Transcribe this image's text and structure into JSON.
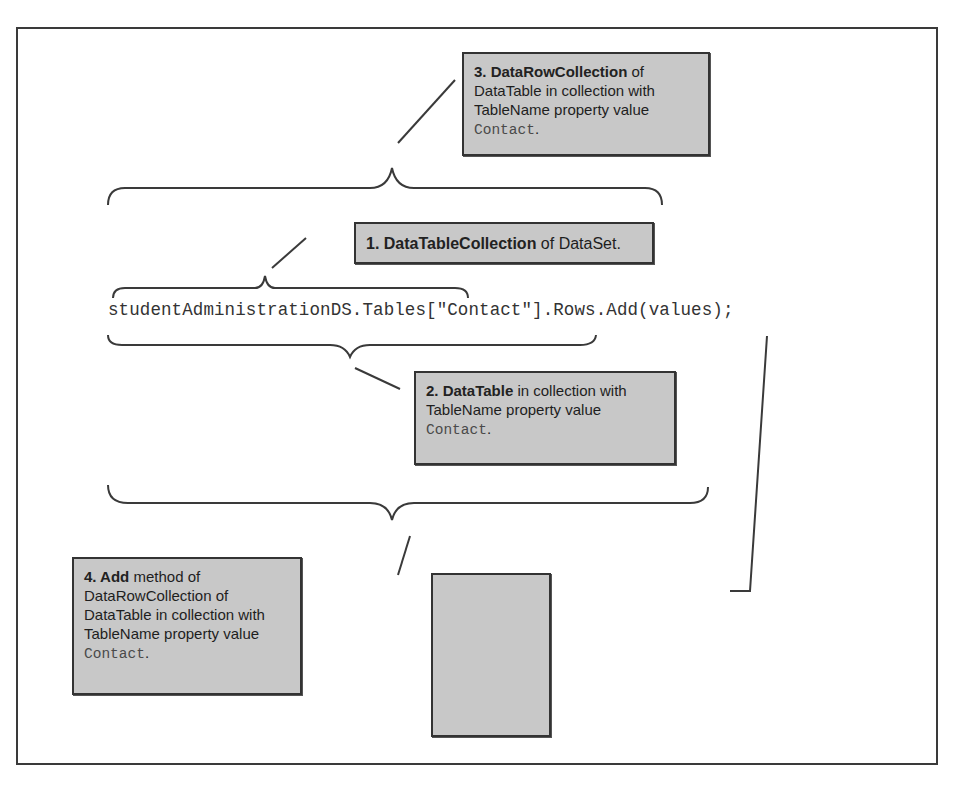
{
  "code": {
    "line": "studentAdministrationDS.Tables[\"Contact\"].Rows.Add(values);"
  },
  "callouts": {
    "c1": {
      "bold": "1. DataTableCollection",
      "rest": " of DataSet."
    },
    "c2": {
      "bold": "2. DataTable",
      "rest": " in collection with TableName property value ",
      "code": "Contact",
      "end": "."
    },
    "c3": {
      "bold": "3. DataRowCollection",
      "rest": " of DataTable in collection with TableName property value ",
      "code": "Contact",
      "end": "."
    },
    "c4": {
      "bold": "4. Add",
      "rest": " method of DataRowCollection of DataTable in collection with TableName property value ",
      "code": "Contact",
      "end": "."
    },
    "c5": {
      "bold": "Object",
      "rest": " array with elements corresponding to column values of added row"
    }
  },
  "colors": {
    "callout_bg": "#c8c8c8",
    "border": "#333333",
    "line": "#3a3a3a"
  }
}
